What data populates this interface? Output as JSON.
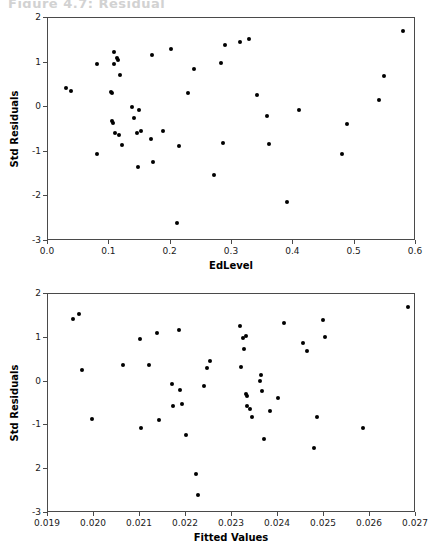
{
  "clipped_title": "Figure 4.7: Residual",
  "chart_data": [
    {
      "id": "residuals-vs-edlevel",
      "type": "scatter",
      "title": "",
      "xlabel": "EdLevel",
      "ylabel": "Std Residuals",
      "xlim": [
        0.0,
        0.6
      ],
      "ylim": [
        -3,
        2
      ],
      "xticks": [
        0.0,
        0.1,
        0.2,
        0.3,
        0.4,
        0.5,
        0.6
      ],
      "xticklabels": [
        "0.0",
        "0.1",
        "0.2",
        "0.3",
        "0.4",
        "0.5",
        "0.6"
      ],
      "yticks": [
        2,
        1,
        0,
        -1,
        -2,
        -3
      ],
      "yticklabels": [
        "2",
        "1",
        "0",
        "-1",
        "-2",
        "-3"
      ],
      "grid": false,
      "legend": "none",
      "marker_color": "#000000",
      "points": [
        [
          0.03,
          0.44
        ],
        [
          0.038,
          0.37
        ],
        [
          0.08,
          0.97
        ],
        [
          0.08,
          -1.06
        ],
        [
          0.103,
          0.35
        ],
        [
          0.104,
          0.31
        ],
        [
          0.105,
          -0.32
        ],
        [
          0.106,
          -0.36
        ],
        [
          0.107,
          0.97
        ],
        [
          0.108,
          1.24
        ],
        [
          0.11,
          -0.57
        ],
        [
          0.113,
          1.1
        ],
        [
          0.114,
          1.06
        ],
        [
          0.116,
          -0.63
        ],
        [
          0.118,
          0.73
        ],
        [
          0.12,
          -0.85
        ],
        [
          0.137,
          0.0
        ],
        [
          0.14,
          -0.24
        ],
        [
          0.145,
          -0.57
        ],
        [
          0.147,
          -1.33
        ],
        [
          0.148,
          -0.06
        ],
        [
          0.152,
          -0.54
        ],
        [
          0.168,
          -0.71
        ],
        [
          0.17,
          1.16
        ],
        [
          0.172,
          -1.23
        ],
        [
          0.188,
          -0.53
        ],
        [
          0.2,
          1.31
        ],
        [
          0.211,
          -2.59
        ],
        [
          0.213,
          -0.88
        ],
        [
          0.229,
          0.31
        ],
        [
          0.238,
          0.86
        ],
        [
          0.27,
          -1.51
        ],
        [
          0.282,
          1.0
        ],
        [
          0.286,
          -0.81
        ],
        [
          0.288,
          1.39
        ],
        [
          0.313,
          1.47
        ],
        [
          0.327,
          1.54
        ],
        [
          0.34,
          0.28
        ],
        [
          0.357,
          -0.19
        ],
        [
          0.36,
          -0.82
        ],
        [
          0.39,
          -2.12
        ],
        [
          0.409,
          -0.07
        ],
        [
          0.479,
          -1.06
        ],
        [
          0.487,
          -0.37
        ],
        [
          0.54,
          0.16
        ],
        [
          0.548,
          0.7
        ],
        [
          0.578,
          1.71
        ]
      ]
    },
    {
      "id": "residuals-vs-fitted",
      "type": "scatter",
      "title": "",
      "xlabel": "Fitted Values",
      "ylabel": "Std Residuals",
      "xlim": [
        0.019,
        0.027
      ],
      "ylim": [
        -3,
        2
      ],
      "xticks": [
        0.019,
        0.02,
        0.021,
        0.022,
        0.023,
        0.024,
        0.025,
        0.026,
        0.027
      ],
      "xticklabels": [
        "0.019",
        "0.020",
        "0.021",
        "0.022",
        "0.023",
        "0.024",
        "0.025",
        "0.026",
        "0.027"
      ],
      "yticks": [
        2,
        1,
        0,
        -1,
        -2,
        -3
      ],
      "yticklabels": [
        "2",
        "1",
        "0",
        "-1",
        "2",
        "-3"
      ],
      "grid": false,
      "legend": "none",
      "marker_color": "#000000",
      "points": [
        [
          0.01955,
          1.44
        ],
        [
          0.01968,
          1.54
        ],
        [
          0.01973,
          0.27
        ],
        [
          0.01995,
          -0.86
        ],
        [
          0.02063,
          0.38
        ],
        [
          0.021,
          0.98
        ],
        [
          0.02102,
          -1.05
        ],
        [
          0.0212,
          0.38
        ],
        [
          0.02138,
          1.12
        ],
        [
          0.02142,
          -0.88
        ],
        [
          0.0217,
          -0.05
        ],
        [
          0.02172,
          -0.55
        ],
        [
          0.02185,
          1.17
        ],
        [
          0.02187,
          -0.2
        ],
        [
          0.02192,
          -0.52
        ],
        [
          0.022,
          -1.22
        ],
        [
          0.02222,
          -2.12
        ],
        [
          0.02226,
          -2.59
        ],
        [
          0.0224,
          -0.09
        ],
        [
          0.02245,
          0.31
        ],
        [
          0.02252,
          0.46
        ],
        [
          0.02318,
          1.27
        ],
        [
          0.0232,
          0.33
        ],
        [
          0.02324,
          1.0
        ],
        [
          0.02327,
          0.75
        ],
        [
          0.0233,
          -0.29
        ],
        [
          0.02331,
          1.05
        ],
        [
          0.02332,
          -0.33
        ],
        [
          0.02333,
          -0.55
        ],
        [
          0.0234,
          -0.62
        ],
        [
          0.02344,
          -0.81
        ],
        [
          0.0236,
          0.01
        ],
        [
          0.02362,
          0.16
        ],
        [
          0.02366,
          -0.21
        ],
        [
          0.0237,
          -1.3
        ],
        [
          0.02382,
          -0.68
        ],
        [
          0.024,
          -0.37
        ],
        [
          0.02413,
          1.33
        ],
        [
          0.02455,
          0.89
        ],
        [
          0.02462,
          0.69
        ],
        [
          0.02478,
          -1.51
        ],
        [
          0.02485,
          -0.8
        ],
        [
          0.02498,
          1.41
        ],
        [
          0.02502,
          1.02
        ],
        [
          0.02585,
          -1.06
        ],
        [
          0.02683,
          1.71
        ]
      ]
    }
  ],
  "layout": {
    "top_plot": {
      "left": 47,
      "top": 17,
      "width": 368,
      "height": 223
    },
    "bottom_plot": {
      "left": 47,
      "top": 293,
      "width": 368,
      "height": 219
    }
  }
}
